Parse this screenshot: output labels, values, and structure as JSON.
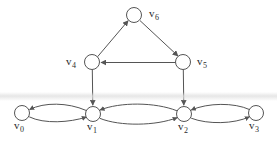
{
  "figure": {
    "type": "directed-graph",
    "width": 277,
    "height": 146,
    "background_color": "#ffffff",
    "stroke_color": "#555555",
    "label_color": "#2b2b2b",
    "node_fill": "#ffffff"
  },
  "nodes": [
    {
      "id": "v0",
      "name": "v",
      "subscript": "0",
      "cx": 22,
      "cy": 113,
      "r": 7.5,
      "label_x": 16,
      "label_y": 126
    },
    {
      "id": "v1",
      "name": "v",
      "subscript": "1",
      "cx": 93,
      "cy": 114,
      "r": 7.5,
      "label_x": 88,
      "label_y": 127
    },
    {
      "id": "v2",
      "name": "v",
      "subscript": "2",
      "cx": 184,
      "cy": 114,
      "r": 7.5,
      "label_x": 179,
      "label_y": 127
    },
    {
      "id": "v3",
      "name": "v",
      "subscript": "3",
      "cx": 256,
      "cy": 113,
      "r": 7.5,
      "label_x": 250,
      "label_y": 126
    },
    {
      "id": "v4",
      "name": "v",
      "subscript": "4",
      "cx": 92,
      "cy": 62,
      "r": 7.5,
      "label_x": 68,
      "label_y": 63
    },
    {
      "id": "v5",
      "name": "v",
      "subscript": "5",
      "cx": 183,
      "cy": 62,
      "r": 7.5,
      "label_x": 198,
      "label_y": 63
    },
    {
      "id": "v6",
      "name": "v",
      "subscript": "6",
      "cx": 134,
      "cy": 15,
      "r": 7.5,
      "label_x": 150,
      "label_y": 15
    }
  ],
  "edges": [
    {
      "from": "v4",
      "to": "v6",
      "style": "straight",
      "label": ""
    },
    {
      "from": "v6",
      "to": "v5",
      "style": "straight",
      "label": ""
    },
    {
      "from": "v5",
      "to": "v4",
      "style": "straight",
      "label": ""
    },
    {
      "from": "v4",
      "to": "v1",
      "style": "straight",
      "label": ""
    },
    {
      "from": "v5",
      "to": "v2",
      "style": "straight",
      "label": ""
    },
    {
      "from": "v1",
      "to": "v0",
      "style": "curved-upper",
      "label": ""
    },
    {
      "from": "v0",
      "to": "v1",
      "style": "curved-lower",
      "label": ""
    },
    {
      "from": "v2",
      "to": "v1",
      "style": "curved-upper",
      "label": ""
    },
    {
      "from": "v1",
      "to": "v2",
      "style": "curved-lower",
      "label": ""
    },
    {
      "from": "v3",
      "to": "v2",
      "style": "curved-upper",
      "label": ""
    },
    {
      "from": "v2",
      "to": "v3",
      "style": "curved-lower",
      "label": ""
    }
  ],
  "artifacts": {
    "scan_band_label": "horizontal scan band"
  }
}
